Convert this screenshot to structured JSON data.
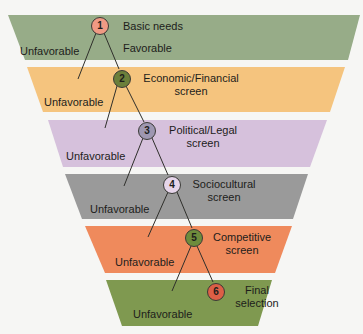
{
  "diagram": {
    "type": "funnel-decision-tree",
    "stages": [
      {
        "number": "1",
        "label_line1": "Basic needs",
        "label_line2": "",
        "branch_left": "Unfavorable",
        "branch_right": "Favorable",
        "band_color": "#97ac88",
        "node_color": "#f09a84"
      },
      {
        "number": "2",
        "label_line1": "Economic/Financial",
        "label_line2": "screen",
        "branch_left": "Unfavorable",
        "band_color": "#f5c47e",
        "node_color": "#6b7f3a"
      },
      {
        "number": "3",
        "label_line1": "Political/Legal",
        "label_line2": "screen",
        "branch_left": "Unfavorable",
        "band_color": "#d6c1dc",
        "node_color": "#9e97b1"
      },
      {
        "number": "4",
        "label_line1": "Sociocultural",
        "label_line2": "screen",
        "branch_left": "Unfavorable",
        "band_color": "#9a9a9a",
        "node_color": "#e6d5ea"
      },
      {
        "number": "5",
        "label_line1": "Competitive",
        "label_line2": "screen",
        "branch_left": "Unfavorable",
        "band_color": "#ef8a5c",
        "node_color": "#6e8c3c"
      },
      {
        "number": "6",
        "label_line1": "Final",
        "label_line2": "selection",
        "branch_left": "Unfavorable",
        "band_color": "#7f9950",
        "node_color": "#dc5f46"
      }
    ]
  }
}
